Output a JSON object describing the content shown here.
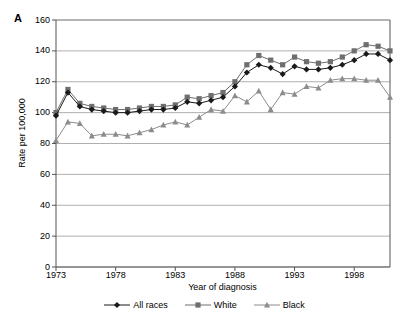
{
  "panel": {
    "label": "A"
  },
  "axes": {
    "ylabel": "Rate per 100,000",
    "xlabel": "Year of diagnosis",
    "yticks": [
      "0",
      "20",
      "40",
      "60",
      "80",
      "100",
      "120",
      "140",
      "160"
    ],
    "xticks": [
      "1973",
      "1978",
      "1983",
      "1988",
      "1993",
      "1998"
    ]
  },
  "legend": {
    "items": [
      {
        "label": "All races",
        "marker": "diamond-marker",
        "color": "#1a1a1a"
      },
      {
        "label": "White",
        "marker": "square-marker",
        "color": "#6e6e6e"
      },
      {
        "label": "Black",
        "marker": "triangle-marker",
        "color": "#8c8c8c"
      }
    ]
  },
  "chart_data": {
    "type": "line",
    "title": "",
    "subtitle": "",
    "xlabel": "Year of diagnosis",
    "ylabel": "Rate per 100,000",
    "xlim": [
      1973,
      2001
    ],
    "ylim": [
      0,
      160
    ],
    "ytick_step": 20,
    "grid": "horizontal",
    "legend_position": "bottom-center",
    "x": [
      1973,
      1974,
      1975,
      1976,
      1977,
      1978,
      1979,
      1980,
      1981,
      1982,
      1983,
      1984,
      1985,
      1986,
      1987,
      1988,
      1989,
      1990,
      1991,
      1992,
      1993,
      1994,
      1995,
      1996,
      1997,
      1998,
      1999,
      2000,
      2001
    ],
    "series": [
      {
        "name": "All races",
        "marker": "diamond",
        "color": "#1a1a1a",
        "values": [
          98,
          113,
          104,
          102,
          101,
          100,
          100,
          101,
          102,
          102,
          103,
          107,
          106,
          108,
          110,
          117,
          126,
          131,
          129,
          125,
          130,
          128,
          128,
          129,
          131,
          134,
          138,
          138,
          134
        ]
      },
      {
        "name": "White",
        "marker": "square",
        "color": "#6e6e6e",
        "values": [
          100,
          115,
          106,
          104,
          103,
          102,
          102,
          103,
          104,
          104,
          105,
          110,
          109,
          111,
          113,
          120,
          131,
          137,
          134,
          131,
          136,
          133,
          132,
          133,
          136,
          140,
          144,
          143,
          140
        ]
      },
      {
        "name": "Black",
        "marker": "triangle",
        "color": "#8c8c8c",
        "values": [
          82,
          94,
          93,
          85,
          86,
          86,
          85,
          87,
          89,
          92,
          94,
          92,
          97,
          102,
          101,
          111,
          107,
          114,
          102,
          113,
          112,
          117,
          116,
          121,
          122,
          122,
          121,
          121,
          110
        ]
      }
    ]
  }
}
